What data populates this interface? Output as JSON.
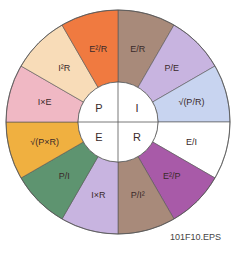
{
  "diagram": {
    "type": "ohms-law-power-wheel",
    "center_quadrants": [
      {
        "label": "P",
        "quadrant": "top-left"
      },
      {
        "label": "I",
        "quadrant": "top-right"
      },
      {
        "label": "E",
        "quadrant": "bottom-left"
      },
      {
        "label": "R",
        "quadrant": "bottom-right"
      }
    ],
    "segments": [
      {
        "formula": "E/R",
        "variable": "I",
        "color": "#a88a7a"
      },
      {
        "formula": "P/E",
        "variable": "I",
        "color": "#c8b4e0"
      },
      {
        "formula": "√(P/R)",
        "variable": "I",
        "color": "#c8d4f0"
      },
      {
        "formula": "E/I",
        "variable": "R",
        "color": "#ffffff"
      },
      {
        "formula": "E²/P",
        "variable": "R",
        "color": "#a85aa8"
      },
      {
        "formula": "P/I²",
        "variable": "R",
        "color": "#a88a7a"
      },
      {
        "formula": "I×R",
        "variable": "E",
        "color": "#c8b4e0"
      },
      {
        "formula": "P/I",
        "variable": "E",
        "color": "#5e9470"
      },
      {
        "formula": "√(P×R)",
        "variable": "E",
        "color": "#f0b040"
      },
      {
        "formula": "I×E",
        "variable": "P",
        "color": "#f0b8c4"
      },
      {
        "formula": "I²R",
        "variable": "P",
        "color": "#f8dcb8"
      },
      {
        "formula": "E²/R",
        "variable": "P",
        "color": "#f07a40"
      }
    ]
  },
  "caption": "101F10.EPS"
}
